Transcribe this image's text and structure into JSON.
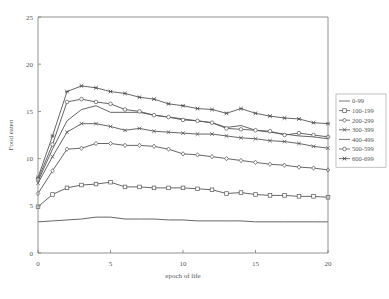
{
  "chart_data": {
    "type": "line",
    "title": "",
    "xlabel": "epoch of life",
    "ylabel": "Food eaten",
    "xlim": [
      0,
      20
    ],
    "ylim": [
      0,
      25
    ],
    "xticks": [
      0,
      5,
      10,
      15,
      20
    ],
    "yticks": [
      0,
      5,
      10,
      15,
      20,
      25
    ],
    "grid": false,
    "legend_position": "right",
    "x": [
      0,
      1,
      2,
      3,
      4,
      5,
      6,
      7,
      8,
      9,
      10,
      11,
      12,
      13,
      14,
      15,
      16,
      17,
      18,
      19,
      20
    ],
    "series": [
      {
        "name": "0-99",
        "marker": "none",
        "values": [
          3.3,
          3.4,
          3.5,
          3.6,
          3.8,
          3.8,
          3.6,
          3.6,
          3.6,
          3.5,
          3.5,
          3.4,
          3.4,
          3.4,
          3.4,
          3.3,
          3.3,
          3.3,
          3.3,
          3.3,
          3.3
        ]
      },
      {
        "name": "100-199",
        "marker": "square",
        "values": [
          4.9,
          6.2,
          6.9,
          7.2,
          7.3,
          7.5,
          7.0,
          7.0,
          6.9,
          6.9,
          6.9,
          6.8,
          6.7,
          6.3,
          6.4,
          6.2,
          6.1,
          6.1,
          6.0,
          6.0,
          5.9
        ]
      },
      {
        "name": "200-299",
        "marker": "diamond",
        "values": [
          6.3,
          8.7,
          11.0,
          11.1,
          11.6,
          11.6,
          11.4,
          11.4,
          11.3,
          11.0,
          10.5,
          10.4,
          10.2,
          10.0,
          9.8,
          9.6,
          9.4,
          9.3,
          9.1,
          9.0,
          8.8
        ]
      },
      {
        "name": "300-399",
        "marker": "x",
        "values": [
          7.4,
          10.2,
          12.8,
          13.7,
          13.7,
          13.4,
          13.0,
          13.2,
          12.9,
          12.8,
          12.7,
          12.6,
          12.6,
          12.4,
          12.2,
          12.1,
          11.9,
          11.8,
          11.6,
          11.3,
          11.1
        ]
      },
      {
        "name": "400-499",
        "marker": "none",
        "values": [
          7.6,
          11.0,
          14.0,
          15.2,
          15.6,
          14.9,
          14.9,
          14.9,
          14.6,
          14.4,
          14.2,
          14.0,
          13.8,
          13.3,
          13.5,
          13.0,
          12.8,
          12.6,
          12.4,
          12.3,
          12.1
        ]
      },
      {
        "name": "500-599",
        "marker": "circle",
        "values": [
          7.8,
          11.5,
          16.0,
          16.3,
          16.0,
          15.8,
          15.2,
          15.0,
          14.6,
          14.4,
          14.1,
          14.0,
          13.8,
          13.2,
          13.1,
          13.0,
          12.9,
          12.5,
          12.7,
          12.5,
          12.3
        ]
      },
      {
        "name": "600-699",
        "marker": "star",
        "values": [
          8.0,
          12.4,
          17.1,
          17.7,
          17.5,
          17.1,
          16.9,
          16.5,
          16.3,
          15.8,
          15.6,
          15.3,
          15.2,
          14.8,
          15.3,
          14.8,
          14.5,
          14.3,
          14.2,
          13.8,
          13.7
        ]
      }
    ]
  },
  "colors": {
    "line": "#555555",
    "axis": "#777777",
    "text": "#555555"
  }
}
